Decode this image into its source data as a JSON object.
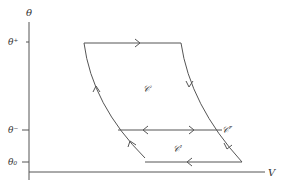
{
  "diagram": {
    "type": "thermodynamic-cycle",
    "axes": {
      "y_label": "θ",
      "x_label": "V",
      "y_ticks": [
        {
          "label": "θ⁺",
          "y": 42
        },
        {
          "label": "θ⁻",
          "y": 130
        },
        {
          "label": "θ₀",
          "y": 162
        }
      ]
    },
    "regions": {
      "upper": "𝒞",
      "middle_right": "𝒞″",
      "lower": "𝒞′"
    },
    "colors": {
      "line": "#555555",
      "text": "#333333"
    }
  }
}
